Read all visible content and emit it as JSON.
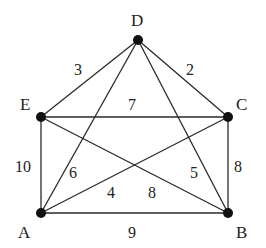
{
  "graph": {
    "nodes": [
      {
        "id": "D",
        "label": "D",
        "x": 138,
        "y": 40
      },
      {
        "id": "E",
        "label": "E",
        "x": 41,
        "y": 117
      },
      {
        "id": "C",
        "label": "C",
        "x": 228,
        "y": 117
      },
      {
        "id": "A",
        "label": "A",
        "x": 41,
        "y": 213
      },
      {
        "id": "B",
        "label": "B",
        "x": 228,
        "y": 213
      }
    ],
    "edges": [
      {
        "from": "D",
        "to": "E",
        "weight": "3"
      },
      {
        "from": "D",
        "to": "C",
        "weight": "2"
      },
      {
        "from": "E",
        "to": "C",
        "weight": "7"
      },
      {
        "from": "E",
        "to": "A",
        "weight": "10"
      },
      {
        "from": "C",
        "to": "B",
        "weight": "8"
      },
      {
        "from": "A",
        "to": "B",
        "weight": "9"
      },
      {
        "from": "D",
        "to": "A",
        "weight": "6"
      },
      {
        "from": "D",
        "to": "B",
        "weight": "5"
      },
      {
        "from": "A",
        "to": "C",
        "weight": "4"
      },
      {
        "from": "E",
        "to": "B",
        "weight": "8"
      }
    ]
  }
}
